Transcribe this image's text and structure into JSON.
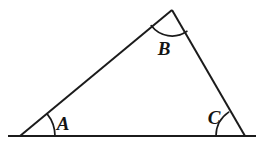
{
  "figure": {
    "title": "Triangle with labeled interior angles",
    "background_color": "#ffffff",
    "stroke_color": "#1b1b1b",
    "label_color": "#141414",
    "width": 264,
    "height": 147,
    "shape": "triangle",
    "vertices": [
      {
        "name": "A",
        "x": 20,
        "y": 136
      },
      {
        "name": "B",
        "x": 172,
        "y": 10
      },
      {
        "name": "C",
        "x": 245,
        "y": 136
      }
    ],
    "baseline": {
      "x1": 8,
      "y1": 136,
      "x2": 256,
      "y2": 136
    },
    "sides": [
      {
        "name": "side-AB",
        "x1": 20,
        "y1": 136,
        "x2": 172,
        "y2": 10
      },
      {
        "name": "side-BC",
        "x1": 172,
        "y1": 10,
        "x2": 245,
        "y2": 136
      },
      {
        "name": "side-AC",
        "x1": 20,
        "y1": 136,
        "x2": 245,
        "y2": 136
      }
    ],
    "angles": [
      {
        "label": "A",
        "vertex_x": 20,
        "vertex_y": 136,
        "arc_radius": 35,
        "arc_path": "M 55 136 A 35 35 0 0 0 47.3 114.1",
        "label_x": 63,
        "label_y": 130
      },
      {
        "label": "B",
        "vertex_x": 172,
        "vertex_y": 10,
        "arc_radius": 26,
        "arc_path": "M 151.2 25.6 A 26 26 0 0 0 186.9 31.3",
        "label_x": 164,
        "label_y": 55
      },
      {
        "label": "C",
        "vertex_x": 245,
        "vertex_y": 136,
        "arc_radius": 29,
        "arc_path": "M 216 136 A 29 29 0 0 1 228.7 112.1",
        "label_x": 214,
        "label_y": 124
      }
    ]
  }
}
